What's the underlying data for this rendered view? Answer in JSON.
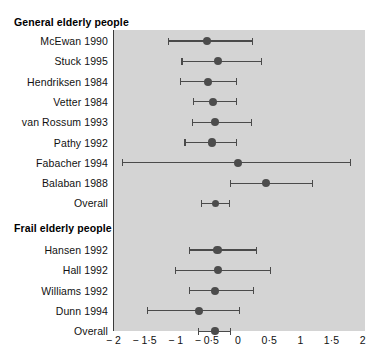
{
  "figure": {
    "type": "forest-plot",
    "background": "#ffffff",
    "panel_color": "#d4d4d4",
    "marker_color": "#4c4c4c",
    "line_color": "#4a4a4a",
    "zero_line_color": "#3a3a3a"
  },
  "groups": [
    {
      "label": "General elderly people"
    },
    {
      "label": "Frail elderly people"
    }
  ],
  "axis": {
    "ticks": [
      "− 2",
      "− 1·5",
      "− 1",
      "− 0·5",
      "0",
      "0·5",
      "1",
      "1·5",
      "2"
    ],
    "tick_values": [
      -2,
      -1.5,
      -1,
      -0.5,
      0,
      0.5,
      1,
      1.5,
      2
    ],
    "min": -2,
    "max": 2,
    "null_value": 0
  },
  "chart_data": {
    "type": "forest",
    "title": "",
    "xlabel": "",
    "ylabel": "",
    "xlim": [
      -2,
      2
    ],
    "null_line": 0,
    "grid": false,
    "legend": "none",
    "xticks": [
      -2,
      -1.5,
      -1,
      -0.5,
      0,
      0.5,
      1,
      1.5,
      2
    ],
    "xticklabels": [
      "− 2",
      "− 1·5",
      "− 1",
      "− 0·5",
      "0",
      "0·5",
      "1",
      "1·5",
      "2"
    ],
    "groups": [
      {
        "name": "General elderly people",
        "studies": [
          {
            "label": "McEwan 1990",
            "estimate": -0.5,
            "ci_low": -1.12,
            "ci_high": 0.23,
            "is_overall": false
          },
          {
            "label": "Stuck 1995",
            "estimate": -0.32,
            "ci_low": -0.9,
            "ci_high": 0.38,
            "is_overall": false
          },
          {
            "label": "Hendriksen 1984",
            "estimate": -0.48,
            "ci_low": -0.92,
            "ci_high": -0.03,
            "is_overall": false
          },
          {
            "label": "Vetter 1984",
            "estimate": -0.4,
            "ci_low": -0.72,
            "ci_high": -0.03,
            "is_overall": false
          },
          {
            "label": "van Rossum 1993",
            "estimate": -0.37,
            "ci_low": -0.73,
            "ci_high": 0.22,
            "is_overall": false
          },
          {
            "label": "Pathy 1992",
            "estimate": -0.42,
            "ci_low": -0.85,
            "ci_high": -0.02,
            "is_overall": false
          },
          {
            "label": "Fabacher 1994",
            "estimate": 0.0,
            "ci_low": -1.85,
            "ci_high": 1.8,
            "is_overall": false
          },
          {
            "label": "Balaban 1988",
            "estimate": 0.45,
            "ci_low": -0.12,
            "ci_high": 1.2,
            "is_overall": false
          },
          {
            "label": "Overall",
            "estimate": -0.36,
            "ci_low": -0.58,
            "ci_high": -0.13,
            "is_overall": true
          }
        ]
      },
      {
        "name": "Frail elderly people",
        "studies": [
          {
            "label": "Hansen 1992",
            "estimate": -0.33,
            "ci_low": -0.78,
            "ci_high": 0.3,
            "is_overall": false
          },
          {
            "label": "Hall 1992",
            "estimate": -0.32,
            "ci_low": -1.0,
            "ci_high": 0.52,
            "is_overall": false
          },
          {
            "label": "Williams 1992",
            "estimate": -0.37,
            "ci_low": -0.78,
            "ci_high": 0.25,
            "is_overall": false
          },
          {
            "label": "Dunn 1994",
            "estimate": -0.62,
            "ci_low": -1.45,
            "ci_high": 0.02,
            "is_overall": false
          },
          {
            "label": "Overall",
            "estimate": -0.37,
            "ci_low": -0.63,
            "ci_high": -0.12,
            "is_overall": true
          }
        ]
      }
    ]
  }
}
